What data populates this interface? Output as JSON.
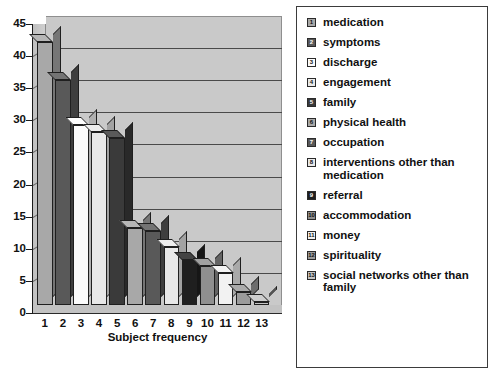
{
  "chart_data": {
    "type": "bar",
    "title": "",
    "xlabel": "Subject frequency",
    "ylabel": "",
    "ylim": [
      0,
      45
    ],
    "ytick_labels": [
      "45",
      "40",
      "35",
      "30",
      "25",
      "20",
      "15",
      "10",
      "5",
      "0"
    ],
    "ytick_values": [
      45,
      40,
      35,
      30,
      25,
      20,
      15,
      10,
      5,
      0
    ],
    "grid": true,
    "legend_position": "right",
    "categories": [
      "1",
      "2",
      "3",
      "4",
      "5",
      "6",
      "7",
      "8",
      "9",
      "10",
      "11",
      "12",
      "13"
    ],
    "values": [
      41,
      35,
      28,
      27,
      26,
      12,
      11.5,
      9,
      7,
      6,
      5,
      2,
      0.5
    ],
    "series": [
      {
        "name": "Subject frequency",
        "values": [
          41,
          35,
          28,
          27,
          26,
          12,
          11.5,
          9,
          7,
          6,
          5,
          2,
          0.5
        ]
      }
    ],
    "bar_colors": [
      "#a8a8a8",
      "#595959",
      "#fbfbfb",
      "#e8e8e8",
      "#3a3a3a",
      "#a8a8a8",
      "#595959",
      "#e8e8e8",
      "#1f1f1f",
      "#8f8f8f",
      "#f2f2f2",
      "#9b9b9b",
      "#c4c4c4"
    ],
    "legend_entries": [
      {
        "key": "1",
        "label": "medication",
        "color": "#a8a8a8",
        "num_color": "#111111"
      },
      {
        "key": "2",
        "label": "symptoms",
        "color": "#595959",
        "num_color": "#ffffff"
      },
      {
        "key": "3",
        "label": "discharge",
        "color": "#fbfbfb",
        "num_color": "#111111"
      },
      {
        "key": "4",
        "label": "engagement",
        "color": "#e8e8e8",
        "num_color": "#111111"
      },
      {
        "key": "5",
        "label": "family",
        "color": "#3a3a3a",
        "num_color": "#ffffff"
      },
      {
        "key": "6",
        "label": "physical health",
        "color": "#a8a8a8",
        "num_color": "#111111"
      },
      {
        "key": "7",
        "label": "occupation",
        "color": "#595959",
        "num_color": "#ffffff"
      },
      {
        "key": "8",
        "label": "interventions other than medication",
        "color": "#e8e8e8",
        "num_color": "#111111"
      },
      {
        "key": "9",
        "label": "referral",
        "color": "#1f1f1f",
        "num_color": "#ffffff"
      },
      {
        "key": "10",
        "label": "accommodation",
        "color": "#8f8f8f",
        "num_color": "#111111"
      },
      {
        "key": "11",
        "label": "money",
        "color": "#f2f2f2",
        "num_color": "#111111"
      },
      {
        "key": "12",
        "label": "spirituality",
        "color": "#9b9b9b",
        "num_color": "#111111"
      },
      {
        "key": "13",
        "label": "social networks other than family",
        "color": "#c4c4c4",
        "num_color": "#111111"
      }
    ],
    "colors": {
      "plot_background": "#c9c9c9",
      "gridline": "#4a4a4a",
      "axis": "#1a1a1a",
      "page_background": "#ffffff",
      "legend_border": "#3b3b3b",
      "text": "#111111"
    }
  }
}
